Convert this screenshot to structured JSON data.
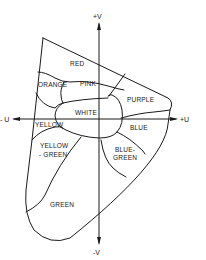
{
  "diagram": {
    "type": "color-region-map",
    "axes": {
      "pos_v": "+V",
      "neg_v": "-V",
      "pos_u": "+U",
      "neg_u": "- U"
    },
    "regions": {
      "red": "RED",
      "orange": "ORANGE",
      "pink": "PINK",
      "white": "WHITE",
      "purple": "PURPLE",
      "yellow": "YELLOW",
      "blue": "BLUE",
      "yellow_green_1": "YELLOW",
      "yellow_green_2": "- GREEN",
      "blue_green_1": "BLUE-",
      "blue_green_2": "GREEN",
      "green": "GREEN"
    },
    "colors": {
      "line": "#1a1a1a",
      "background": "#ffffff"
    }
  }
}
